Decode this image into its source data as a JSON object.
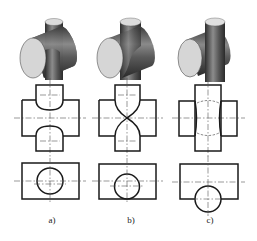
{
  "figure": {
    "type": "engineering drawing - intersecting cylinders",
    "panels": [
      {
        "id": "a",
        "label": "a)",
        "description": "vertical cylinder smaller than horizontal cylinder"
      },
      {
        "id": "b",
        "label": "b)",
        "description": "cylinders of equal diameter"
      },
      {
        "id": "c",
        "label": "c)",
        "description": "vertical cylinder larger, offset"
      }
    ],
    "rows": [
      "isometric-view",
      "front-view",
      "top-view"
    ],
    "colors": {
      "line": "#1a1a1a",
      "center_line": "#555555",
      "shade_dark": "#3a3a3a",
      "shade_light": "#d8d8d8"
    }
  }
}
